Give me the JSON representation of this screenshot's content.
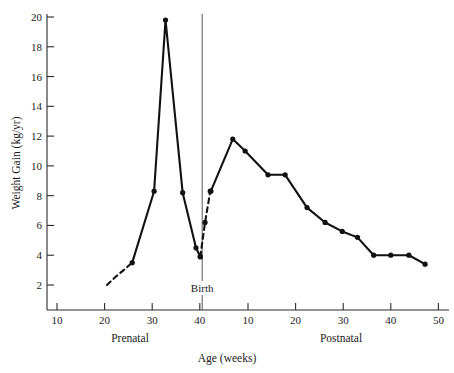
{
  "chart_data": {
    "type": "line",
    "title": "",
    "xlabel": "Age (weeks)",
    "ylabel": "Weight Gain (kg/yr)",
    "ylim": [
      0,
      20
    ],
    "yticks": [
      2,
      4,
      6,
      8,
      10,
      12,
      14,
      16,
      18,
      20
    ],
    "grid": false,
    "legend": null,
    "axis_segments": [
      {
        "name": "Prenatal",
        "label": "Prenatal",
        "ticks": [
          10,
          20,
          30,
          40
        ],
        "tick_labels": [
          "10",
          "20",
          "30",
          "40"
        ],
        "range": [
          4,
          42
        ]
      },
      {
        "name": "Postnatal",
        "label": "Postnatal",
        "ticks": [
          10,
          20,
          30,
          40,
          50
        ],
        "tick_labels": [
          "10",
          "20",
          "30",
          "40",
          "50"
        ],
        "range": [
          0,
          52
        ]
      }
    ],
    "annotations": [
      {
        "name": "birth-marker",
        "text": "Birth",
        "x_axis": "prenatal",
        "x": 40.5,
        "type": "vertical-line-with-label"
      }
    ],
    "series": [
      {
        "name": "prenatal-growth-extrapolated-start",
        "style": "dashed",
        "markers": false,
        "axis": "prenatal",
        "points": [
          {
            "x": 20.5,
            "y": 2.0
          },
          {
            "x": 22.5,
            "y": 2.6
          },
          {
            "x": 24.0,
            "y": 3.0
          },
          {
            "x": 25.8,
            "y": 3.5
          }
        ]
      },
      {
        "name": "prenatal-growth-velocity",
        "style": "solid",
        "markers": true,
        "axis": "prenatal",
        "points": [
          {
            "x": 25.8,
            "y": 3.5
          },
          {
            "x": 30.4,
            "y": 8.3
          },
          {
            "x": 32.8,
            "y": 19.8
          },
          {
            "x": 36.4,
            "y": 8.2
          },
          {
            "x": 39.2,
            "y": 4.5
          },
          {
            "x": 40.1,
            "y": 3.9
          }
        ]
      },
      {
        "name": "birth-transition-interpolated",
        "style": "dashed",
        "markers": true,
        "axis": "prenatal",
        "points": [
          {
            "x": 40.1,
            "y": 3.9
          },
          {
            "x": 41.1,
            "y": 6.2
          },
          {
            "x": 42.2,
            "y": 8.3
          }
        ]
      },
      {
        "name": "postnatal-growth-velocity",
        "style": "solid",
        "markers": true,
        "axis": "postnatal",
        "points": [
          {
            "x": 2.2,
            "y": 8.3
          },
          {
            "x": 6.8,
            "y": 11.8
          },
          {
            "x": 9.4,
            "y": 11.0
          },
          {
            "x": 14.2,
            "y": 9.4
          },
          {
            "x": 17.8,
            "y": 9.4
          },
          {
            "x": 22.4,
            "y": 7.2
          },
          {
            "x": 26.2,
            "y": 6.2
          },
          {
            "x": 29.8,
            "y": 5.6
          },
          {
            "x": 33.0,
            "y": 5.2
          },
          {
            "x": 36.4,
            "y": 4.0
          },
          {
            "x": 40.0,
            "y": 4.0
          },
          {
            "x": 43.8,
            "y": 4.0
          },
          {
            "x": 47.2,
            "y": 3.4
          }
        ]
      }
    ]
  },
  "figure": {
    "y_axis_title": "Weight Gain (kg/yr)",
    "x_axis_title": "Age (weeks)",
    "prenatal_label": "Prenatal",
    "postnatal_label": "Postnatal",
    "birth_label": "Birth"
  }
}
